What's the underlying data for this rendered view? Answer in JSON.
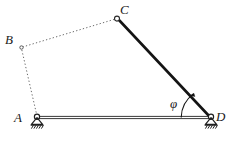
{
  "figure": {
    "kind": "four-bar-linkage-diagram",
    "background_color": "#ffffff",
    "line_color": "#1a1a1a",
    "dotted_color": "#6b6b6b",
    "width": 234,
    "height": 144
  },
  "vertices": [
    {
      "id": "A",
      "label": "A",
      "x": 37,
      "y": 118,
      "label_x": 14,
      "label_y": 122,
      "joint": "pinned-support",
      "joint_shown": true
    },
    {
      "id": "B",
      "label": "B",
      "x": 21,
      "y": 47,
      "label_x": 5,
      "label_y": 44,
      "joint": "revolute-small",
      "joint_shown": true
    },
    {
      "id": "C",
      "label": "C",
      "x": 117,
      "y": 18,
      "label_x": 120,
      "label_y": 14,
      "joint": "revolute",
      "joint_shown": true
    },
    {
      "id": "D",
      "label": "D",
      "x": 211,
      "y": 118,
      "label_x": 216,
      "label_y": 121,
      "joint": "pinned-support",
      "joint_shown": true
    }
  ],
  "links": [
    {
      "id": "AB",
      "from": "A",
      "to": "B",
      "style": "dotted",
      "label": "link-a-b"
    },
    {
      "id": "BC",
      "from": "B",
      "to": "C",
      "style": "dotted",
      "label": "link-b-c"
    },
    {
      "id": "CD",
      "from": "C",
      "to": "D",
      "style": "solid-thick",
      "label": "link-c-d"
    },
    {
      "id": "AD",
      "from": "A",
      "to": "D",
      "style": "solid-ground",
      "label": "ground-line-a-d"
    }
  ],
  "angle": {
    "symbol": "φ",
    "label_x": 172,
    "label_y": 107,
    "vertex": "D",
    "from_ray": "D-to-A (horizontal left)",
    "to_ray": "D-to-C",
    "arc_radius": 30,
    "arrow": true
  },
  "supports": {
    "hatch_count": 5,
    "hatch_label": "ground-hatching",
    "triangle_label": "support-triangle",
    "pin_label": "pin-circle"
  }
}
